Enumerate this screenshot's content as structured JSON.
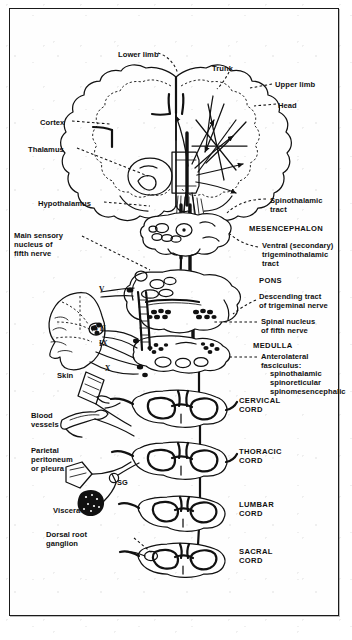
{
  "figure": {
    "kind": "anatomical-diagram",
    "frame_border_color": "#1a1a1a",
    "ink_color": "#111111",
    "paper_color": "#ffffff"
  },
  "labels": {
    "cortex_map": [
      {
        "id": "lower-limb",
        "text": "Lower limb",
        "x": 118,
        "y": 50,
        "align": "left"
      },
      {
        "id": "trunk",
        "text": "Trunk",
        "x": 212,
        "y": 64,
        "align": "left"
      },
      {
        "id": "upper-limb",
        "text": "Upper limb",
        "x": 275,
        "y": 80,
        "align": "left"
      },
      {
        "id": "head",
        "text": "Head",
        "x": 278,
        "y": 101,
        "align": "left"
      }
    ],
    "left_column": [
      {
        "id": "cortex",
        "text": "Cortex",
        "x": 40,
        "y": 118
      },
      {
        "id": "thalamus",
        "text": "Thalamus",
        "x": 28,
        "y": 145
      },
      {
        "id": "hypothalamus",
        "text": "Hypothalamus",
        "x": 38,
        "y": 199
      },
      {
        "id": "main-sensory-nucleus",
        "text": "Main sensory\nnucleus of\nfifth nerve",
        "x": 14,
        "y": 231
      },
      {
        "id": "skin",
        "text": "Skin",
        "x": 57,
        "y": 371
      },
      {
        "id": "blood-vessels",
        "text": "Blood\nvessels",
        "x": 31,
        "y": 411
      },
      {
        "id": "parietal-peritoneum",
        "text": "Parietal\nperitoneum\nor pleura",
        "x": 31,
        "y": 446
      },
      {
        "id": "viscera",
        "text": "Viscera",
        "x": 53,
        "y": 506
      },
      {
        "id": "dorsal-root-ganglion",
        "text": "Dorsal root\nganglion",
        "x": 46,
        "y": 530
      }
    ],
    "right_column": [
      {
        "id": "spinothalamic-tract",
        "text": "Spinothalamic\ntract",
        "x": 270,
        "y": 196
      },
      {
        "id": "mesencephalon",
        "text": "MESENCEPHALON",
        "x": 249,
        "y": 224,
        "caps": true
      },
      {
        "id": "ventral-trigeminothalamic",
        "text": "Ventral (secondary)\ntrigeminothalamic\ntract",
        "x": 262,
        "y": 241
      },
      {
        "id": "pons",
        "text": "PONS",
        "x": 259,
        "y": 276,
        "caps": true
      },
      {
        "id": "descending-tract-trigeminal",
        "text": "Descending tract\nof trigeminal nerve",
        "x": 259,
        "y": 292
      },
      {
        "id": "spinal-nucleus-fifth",
        "text": "Spinal nucleus\nof fifth nerve",
        "x": 261,
        "y": 317
      },
      {
        "id": "medulla",
        "text": "MEDULLA",
        "x": 253,
        "y": 341,
        "caps": true
      },
      {
        "id": "anterolateral-fasciculus",
        "text": "Anterolateral\nfasciculus:",
        "x": 261,
        "y": 352
      },
      {
        "id": "anterolateral-subtracts",
        "text": "spinothalamic\nspinoreticular\nspinomesencephalic",
        "x": 270,
        "y": 369
      },
      {
        "id": "cervical-cord",
        "text": "CERVICAL\nCORD",
        "x": 239,
        "y": 396,
        "caps": true
      },
      {
        "id": "thoracic-cord",
        "text": "THORACIC\nCORD",
        "x": 239,
        "y": 447,
        "caps": true
      },
      {
        "id": "lumbar-cord",
        "text": "LUMBAR\nCORD",
        "x": 239,
        "y": 500,
        "caps": true
      },
      {
        "id": "sacral-cord",
        "text": "SACRAL\nCORD",
        "x": 239,
        "y": 547,
        "caps": true
      }
    ],
    "cranial_nerves": [
      {
        "id": "cn-v",
        "text": "V",
        "x": 99,
        "y": 285
      },
      {
        "id": "cn-vii",
        "text": "VII",
        "x": 94,
        "y": 324
      },
      {
        "id": "cn-ix",
        "text": "IX",
        "x": 99,
        "y": 339
      },
      {
        "id": "cn-x",
        "text": "X",
        "x": 105,
        "y": 364
      }
    ],
    "misc": [
      {
        "id": "sympathetic-ganglion",
        "text": "SG",
        "x": 117,
        "y": 478
      }
    ]
  },
  "structures": {
    "brain": "coronal cerebral hemispheres with homunculus fibres",
    "sections": [
      "mesencephalon",
      "pons",
      "medulla",
      "cervical cord",
      "thoracic cord",
      "lumbar cord",
      "sacral cord"
    ],
    "receptor_organs": [
      "skin",
      "blood vessels",
      "parietal peritoneum or pleura",
      "viscera"
    ]
  }
}
